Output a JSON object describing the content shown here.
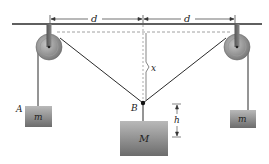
{
  "diagram": {
    "title": "",
    "labels": {
      "d_left": "d",
      "d_right": "d",
      "x": "x",
      "point_A": "A",
      "point_B": "B",
      "h": "h",
      "mass_left": "m",
      "mass_right": "m",
      "mass_center": "M"
    },
    "colors": {
      "line": "#2a2a2a",
      "dashed": "#777777",
      "pulley_outer": "#8a8a8a",
      "pulley_inner": "#a8a8a8",
      "block_top": "#b5b5b5",
      "block_bottom": "#6e6e6e"
    }
  }
}
